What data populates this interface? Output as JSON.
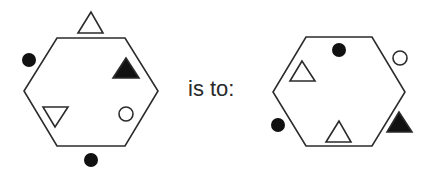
{
  "puzzle": {
    "connector_text": "is to:",
    "colors": {
      "stroke": "#2b2b2b",
      "fill_dark": "#111111",
      "fill_light": "#ffffff"
    },
    "left_figure": {
      "shape": "hexagon",
      "elements": [
        {
          "type": "triangle-outline",
          "position": "outside-top"
        },
        {
          "type": "dot-black",
          "position": "outside-upper-left"
        },
        {
          "type": "triangle-black",
          "position": "inside-upper-right"
        },
        {
          "type": "triangle-inverted-outline",
          "position": "inside-lower-left"
        },
        {
          "type": "circle-outline",
          "position": "inside-lower-right"
        },
        {
          "type": "dot-black",
          "position": "outside-bottom"
        }
      ]
    },
    "right_figure": {
      "shape": "hexagon",
      "elements": [
        {
          "type": "dot-black",
          "position": "inside-top"
        },
        {
          "type": "circle-outline",
          "position": "outside-upper-right"
        },
        {
          "type": "triangle-outline",
          "position": "inside-upper-left"
        },
        {
          "type": "dot-black",
          "position": "outside-lower-left"
        },
        {
          "type": "triangle-outline",
          "position": "inside-bottom"
        },
        {
          "type": "triangle-black",
          "position": "outside-lower-right"
        }
      ]
    }
  }
}
